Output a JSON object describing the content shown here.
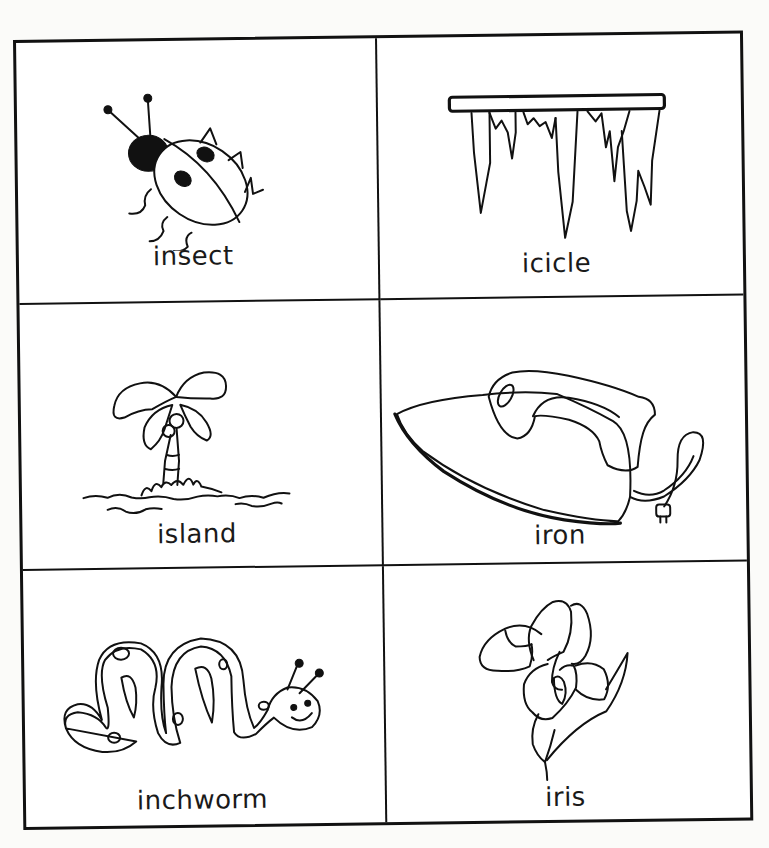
{
  "worksheet": {
    "cards": [
      {
        "word": "insect",
        "picture": "ladybug-insect-icon"
      },
      {
        "word": "icicle",
        "picture": "icicle-icon"
      },
      {
        "word": "island",
        "picture": "palm-island-icon"
      },
      {
        "word": "iron",
        "picture": "clothes-iron-icon"
      },
      {
        "word": "inchworm",
        "picture": "inchworm-icon"
      },
      {
        "word": "iris",
        "picture": "iris-flower-icon"
      }
    ]
  }
}
